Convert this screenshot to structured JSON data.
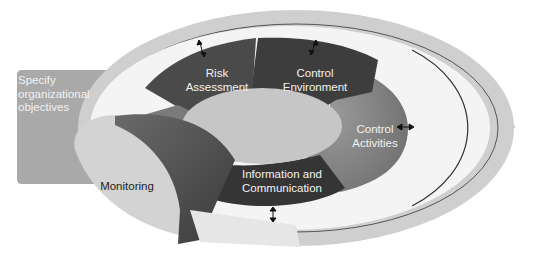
{
  "diagram": {
    "type": "COSO internal control cycle",
    "arrow_band": {
      "label_line1": "Specify",
      "label_line2": "organizational",
      "label_line3": "objectives",
      "color": "#a7a7a7"
    },
    "components": [
      {
        "id": "risk-assessment",
        "line1": "Risk",
        "line2": "Assessment",
        "color": "#4a4a4a"
      },
      {
        "id": "control-environment",
        "line1": "Control",
        "line2": "Environment",
        "color": "#3c3c3c"
      },
      {
        "id": "control-activities",
        "line1": "Control",
        "line2": "Activities",
        "color": "#8a8a8a"
      },
      {
        "id": "information-communication",
        "line1": "Information and",
        "line2": "Communication",
        "color": "#3a3a3a"
      },
      {
        "id": "monitoring",
        "line1": "Monitoring",
        "color": "#d2d2d2"
      }
    ],
    "colors": {
      "outer_ring": "#cfcfcf",
      "white_gap": "#f4f4f4",
      "center": "#c4c4c4",
      "monitoring_ribbon": "#555555"
    },
    "arrows": [
      {
        "position": "top-left",
        "symbol": "double-arrow"
      },
      {
        "position": "top-right",
        "symbol": "double-arrow"
      },
      {
        "position": "right",
        "symbol": "double-arrow"
      },
      {
        "position": "bottom",
        "symbol": "double-arrow"
      }
    ]
  }
}
